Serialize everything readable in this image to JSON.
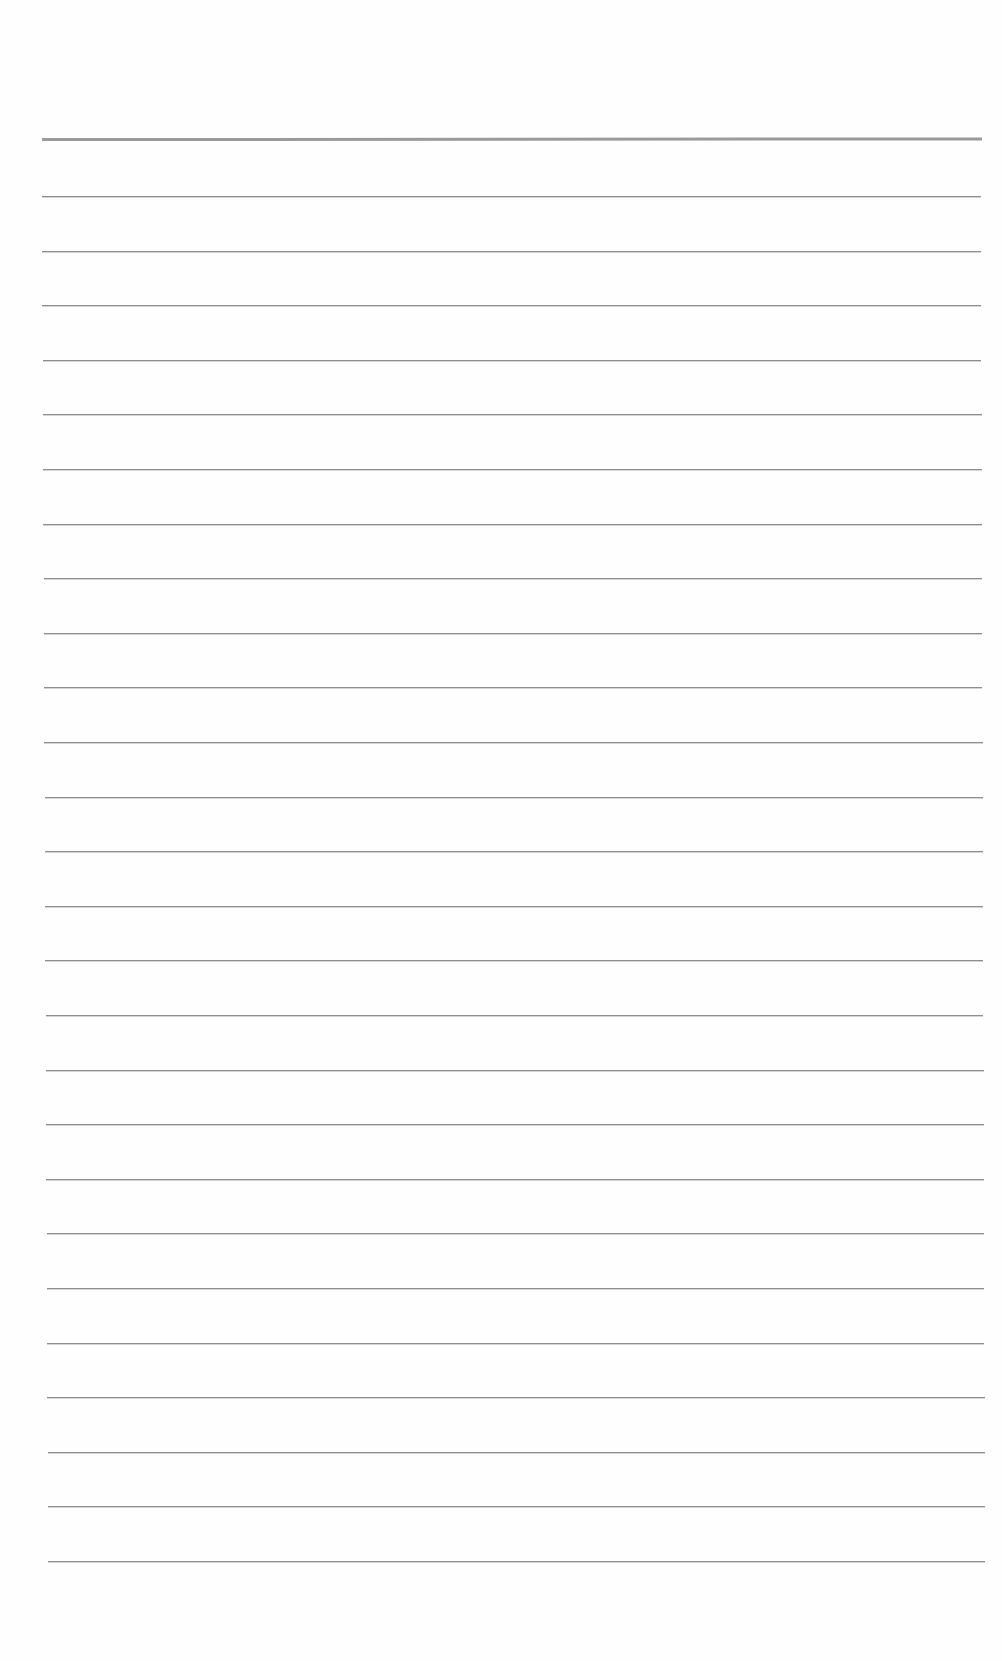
{
  "page": {
    "type": "ruled-notebook-sheet",
    "background_color": "#fefefe"
  },
  "header_rule": {
    "y": 138,
    "left": 42,
    "width": 940,
    "thickness": 3,
    "color": "#9a9a9a"
  },
  "ruled_lines": {
    "count": 26,
    "first_y": 196,
    "spacing": 54.6,
    "left_start": 42,
    "left_end": 48,
    "right_start": 981,
    "right_end": 985,
    "color": "#8e8e8e"
  }
}
